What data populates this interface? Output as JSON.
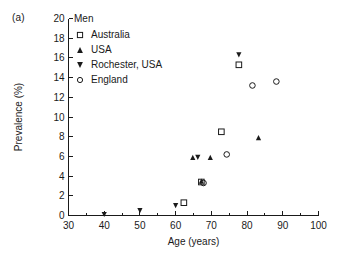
{
  "panel": {
    "label": "(a)"
  },
  "legend": {
    "title": "Men",
    "entries": [
      {
        "label": "Australia",
        "marker": "open-square-icon"
      },
      {
        "label": "USA",
        "marker": "filled-triangle-up-icon"
      },
      {
        "label": "Rochester, USA",
        "marker": "filled-triangle-down-icon"
      },
      {
        "label": "England",
        "marker": "open-circle-icon"
      }
    ]
  },
  "chart_data": {
    "type": "scatter",
    "title": "",
    "xlabel": "Age (years)",
    "ylabel": "Prevalence (%)",
    "xlim": [
      30,
      100
    ],
    "ylim": [
      0,
      20
    ],
    "xticks": [
      30,
      40,
      50,
      60,
      70,
      80,
      90,
      100
    ],
    "xtick_labels": [
      "30",
      "40",
      "50",
      "60",
      "70",
      "80",
      "90",
      "100"
    ],
    "xminor_step": 5,
    "yticks": [
      0,
      2,
      4,
      6,
      8,
      10,
      12,
      14,
      16,
      18,
      20
    ],
    "ytick_labels": [
      "0",
      "2",
      "4",
      "6",
      "8",
      "10",
      "12",
      "14",
      "16",
      "18",
      "20"
    ],
    "grid": false,
    "legend_position": "upper-left-inside",
    "series": [
      {
        "name": "Australia",
        "marker": "open-square",
        "points": [
          {
            "x": 62.3,
            "y": 1.3
          },
          {
            "x": 67.2,
            "y": 3.4
          },
          {
            "x": 72.8,
            "y": 8.5
          },
          {
            "x": 77.7,
            "y": 15.3
          }
        ]
      },
      {
        "name": "USA",
        "marker": "filled-triangle-up",
        "points": [
          {
            "x": 64.8,
            "y": 5.9
          },
          {
            "x": 67.2,
            "y": 3.5
          },
          {
            "x": 69.7,
            "y": 5.9
          },
          {
            "x": 83.2,
            "y": 7.9
          }
        ]
      },
      {
        "name": "Rochester, USA",
        "marker": "filled-triangle-down",
        "points": [
          {
            "x": 40.0,
            "y": 0.1
          },
          {
            "x": 50.0,
            "y": 0.5
          },
          {
            "x": 60.0,
            "y": 1.0
          },
          {
            "x": 66.2,
            "y": 5.9
          },
          {
            "x": 77.7,
            "y": 16.3
          }
        ]
      },
      {
        "name": "England",
        "marker": "open-circle",
        "points": [
          {
            "x": 67.8,
            "y": 3.3
          },
          {
            "x": 74.3,
            "y": 6.2
          },
          {
            "x": 81.5,
            "y": 13.2
          },
          {
            "x": 88.2,
            "y": 13.6
          }
        ]
      }
    ]
  }
}
